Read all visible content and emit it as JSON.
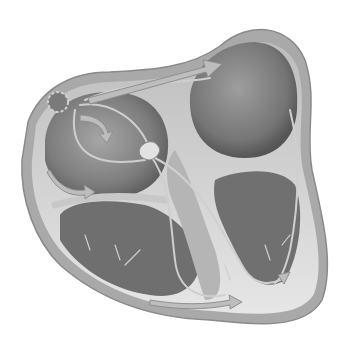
{
  "figure": {
    "style": "grayscale",
    "colors": {
      "background": "#ffffff",
      "outer_wall": "#a9a9a9",
      "wall_highlight": "#d6d6d6",
      "chamber_dark": "#6e6e6e",
      "chamber_mid": "#8c8c8c",
      "pathway": "#c4c4c4",
      "arrow": "#b8b8b8",
      "node": "#7a7a7a"
    },
    "parts": [
      "sinoatrial-node",
      "atrioventricular-node",
      "left-atrium",
      "right-atrium",
      "left-ventricle",
      "right-ventricle",
      "bundle-branches",
      "purkinje-fibers",
      "conduction-arrows"
    ]
  }
}
